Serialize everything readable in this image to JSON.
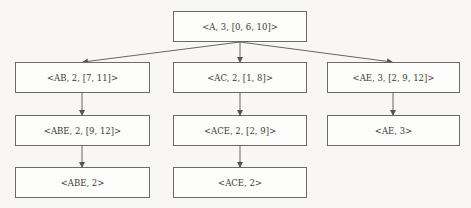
{
  "diagram": {
    "type": "tree",
    "nodes": {
      "root": {
        "label": "<A, 3, [0, 6, 10]>"
      },
      "ab": {
        "label": "<AB, 2, [7, 11]>"
      },
      "ac": {
        "label": "<AC, 2, [1, 8]>"
      },
      "ae": {
        "label": "<AE, 3, [2, 9, 12]>"
      },
      "abe_list": {
        "label": "<ABE, 2, [9, 12]>"
      },
      "ace_list": {
        "label": "<ACE, 2, [2, 9]>"
      },
      "ae_final": {
        "label": "<AE, 3>"
      },
      "abe_final": {
        "label": "<ABE, 2>"
      },
      "ace_final": {
        "label": "<ACE, 2>"
      }
    },
    "edges": [
      [
        "root",
        "ab"
      ],
      [
        "root",
        "ac"
      ],
      [
        "root",
        "ae"
      ],
      [
        "ab",
        "abe_list"
      ],
      [
        "ac",
        "ace_list"
      ],
      [
        "ae",
        "ae_final"
      ],
      [
        "abe_list",
        "abe_final"
      ],
      [
        "ace_list",
        "ace_final"
      ]
    ]
  }
}
